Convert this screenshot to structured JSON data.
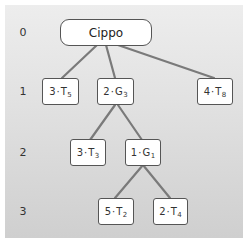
{
  "diagram": {
    "type": "tree",
    "colors": {
      "background_top": "#ededed",
      "background_bottom": "#cfcfcf",
      "edge": "#7a7a7a",
      "node_fill": "#ffffff",
      "node_border": "#555555"
    },
    "levels": [
      {
        "label": "0"
      },
      {
        "label": "1"
      },
      {
        "label": "2"
      },
      {
        "label": "3"
      }
    ],
    "root": {
      "id": "cippo",
      "label": "Cippo",
      "level": 0
    },
    "nodes": [
      {
        "id": "n3T5",
        "level": 1,
        "coef": "3",
        "sep": "·",
        "sym": "T",
        "sub": "5",
        "parent": "cippo"
      },
      {
        "id": "n2G3",
        "level": 1,
        "coef": "2",
        "sep": "·",
        "sym": "G",
        "sub": "3",
        "parent": "cippo"
      },
      {
        "id": "n4T8",
        "level": 1,
        "coef": "4",
        "sep": "·",
        "sym": "T",
        "sub": "8",
        "parent": "cippo"
      },
      {
        "id": "n3T3",
        "level": 2,
        "coef": "3",
        "sep": "·",
        "sym": "T",
        "sub": "3",
        "parent": "n2G3"
      },
      {
        "id": "n1G1",
        "level": 2,
        "coef": "1",
        "sep": "·",
        "sym": "G",
        "sub": "1",
        "parent": "n2G3"
      },
      {
        "id": "n5T2",
        "level": 3,
        "coef": "5",
        "sep": "·",
        "sym": "T",
        "sub": "2",
        "parent": "n1G1"
      },
      {
        "id": "n2T4",
        "level": 3,
        "coef": "2",
        "sep": "·",
        "sym": "T",
        "sub": "4",
        "parent": "n1G1"
      }
    ]
  }
}
